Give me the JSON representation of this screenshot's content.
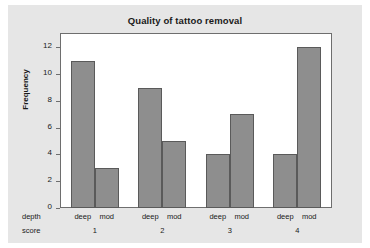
{
  "chart_data": {
    "type": "bar",
    "title": "Quality of tattoo removal",
    "xlabel": "",
    "ylabel": "Frequency",
    "ylim": [
      0,
      13
    ],
    "yticks": [
      0,
      2,
      4,
      6,
      8,
      10,
      12
    ],
    "grid": false,
    "legend": null,
    "row_headers": [
      "depth",
      "score"
    ],
    "categories": [
      "1",
      "2",
      "3",
      "4"
    ],
    "subcategories": [
      "deep",
      "mod"
    ],
    "series": [
      {
        "name": "deep",
        "values": [
          11,
          9,
          4,
          4
        ]
      },
      {
        "name": "mod",
        "values": [
          3,
          5,
          7,
          12
        ]
      }
    ],
    "bars": [
      {
        "group": "1",
        "sub": "deep",
        "value": 11
      },
      {
        "group": "1",
        "sub": "mod",
        "value": 3
      },
      {
        "group": "2",
        "sub": "deep",
        "value": 9
      },
      {
        "group": "2",
        "sub": "mod",
        "value": 5
      },
      {
        "group": "3",
        "sub": "deep",
        "value": 4
      },
      {
        "group": "3",
        "sub": "mod",
        "value": 7
      },
      {
        "group": "4",
        "sub": "deep",
        "value": 4
      },
      {
        "group": "4",
        "sub": "mod",
        "value": 12
      }
    ],
    "colors": {
      "bar_fill": "#8e8e8e",
      "bar_border": "#5a5a5a",
      "plot_background": "#ffffff",
      "figure_background": "#e6e6e6",
      "axis": "#6e6e6e",
      "text": "#1a1a1a"
    }
  }
}
